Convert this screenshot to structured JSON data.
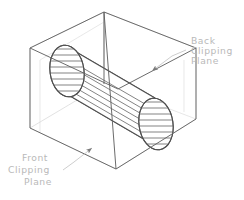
{
  "figure": {
    "background_color": "#ffffff",
    "line_color": "#6a6a6a",
    "faint_line_color": "#d8d8d8",
    "text_color": "#b9b9b9",
    "leader_color": "#c4c4c4"
  },
  "annotations": {
    "back": {
      "line1": "Back",
      "line2": "Clipping",
      "line3": "Plane"
    },
    "front": {
      "line1": "Front",
      "line2": "Clipping",
      "line3": "Plane"
    }
  },
  "geometry": {
    "shapes": [
      "view-frustum-box",
      "front-clipping-plane",
      "back-clipping-plane",
      "hatched-cylinder"
    ]
  }
}
